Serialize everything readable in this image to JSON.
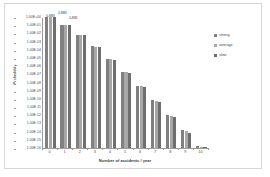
{
  "chart_data": {
    "type": "bar",
    "title": "",
    "xlabel": "Number of accidents / year",
    "ylabel": "Probability",
    "yscale": "log",
    "ylim": [
      1e-16,
      1
    ],
    "grid": false,
    "legend_position": "right",
    "categories": [
      "0",
      "1",
      "2",
      "3",
      "4",
      "5",
      "6",
      "7",
      "8",
      "9",
      "10"
    ],
    "ytick_labels": [
      "1.00E+00",
      "1.00E-01",
      "1.00E-02",
      "1.00E-03",
      "1.00E-04",
      "1.00E-05",
      "1.00E-06",
      "1.00E-07",
      "1.00E-08",
      "1.00E-09",
      "1.00E-10",
      "1.00E-11",
      "1.00E-12",
      "1.00E-13",
      "1.00E-14",
      "1.00E-15",
      "1.00E-16"
    ],
    "series": [
      {
        "name": "strong",
        "color": "#808080",
        "values": [
          0.883,
          0.108,
          0.0066,
          0.00027,
          8.3e-06,
          2e-07,
          4.1e-09,
          7.2e-11,
          1.1e-12,
          1.5e-14,
          1.8e-16
        ]
      },
      {
        "name": "average",
        "color": "#a8a8a8",
        "values": [
          0.881,
          0.104,
          0.0061,
          0.00024,
          7.1e-06,
          1.7e-07,
          3.3e-09,
          5.6e-11,
          8.2e-13,
          1.1e-14,
          1.3e-16
        ]
      },
      {
        "name": "slow",
        "color": "#6e6e6e",
        "values": [
          0.883,
          0.1,
          0.0057,
          0.00021,
          6e-06,
          1.4e-07,
          2.6e-09,
          4.2e-11,
          6e-13,
          7.6e-15,
          8.6e-17
        ]
      }
    ],
    "data_labels": [
      {
        "text": "0.883",
        "category": "0",
        "series": "strong"
      },
      {
        "text": "0.883",
        "category": "0",
        "series": "average"
      },
      {
        "text": "0.881",
        "category": "0",
        "series": "slow"
      }
    ]
  },
  "legend": {
    "items": [
      {
        "label": "strong"
      },
      {
        "label": "average"
      },
      {
        "label": "slow"
      }
    ]
  }
}
